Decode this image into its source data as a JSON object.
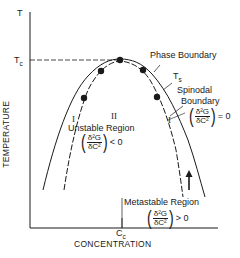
{
  "diagram": {
    "axes": {
      "y_label": "TEMPERATURE",
      "y_symbol": "T",
      "x_label": "CONCENTRATION",
      "tc_label": "T",
      "tc_sub": "c",
      "cc_label": "C",
      "cc_sub": "c"
    },
    "labels": {
      "phase_boundary": "Phase Boundary",
      "ts": "T",
      "ts_sub": "s",
      "spinodal_line1": "Spinodal",
      "spinodal_line2": "Boundary",
      "unstable_numeral": "II",
      "unstable_region": "Unstable Region",
      "region_one_left": "I",
      "region_one_right": "I",
      "metastable_region": "Metastable Region"
    },
    "formulas": {
      "numerator": "δ²G",
      "denominator": "δC²",
      "unstable_rel": "< 0",
      "spinodal_rel": "= 0",
      "metastable_rel": "> 0"
    },
    "colors": {
      "ink": "#1a1a1a",
      "background": "#ffffff"
    }
  }
}
